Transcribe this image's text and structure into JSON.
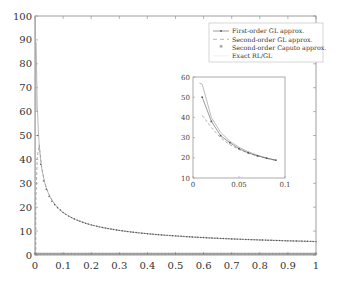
{
  "chart_data": {
    "type": "line",
    "title": "",
    "xlabel": "",
    "ylabel": "",
    "xlim": [
      0,
      1
    ],
    "ylim": [
      0,
      100
    ],
    "grid": false,
    "legend_position": "upper right",
    "x_ticks": [
      "0",
      "0.1",
      "0.2",
      "0.3",
      "0.4",
      "0.5",
      "0.6",
      "0.7",
      "0.8",
      "0.9",
      "1"
    ],
    "y_ticks": [
      "0",
      "10",
      "20",
      "30",
      "40",
      "50",
      "60",
      "70",
      "80",
      "90",
      "100"
    ],
    "legend": [
      {
        "label": "First-order GL approx.",
        "style": "solid-with-dots"
      },
      {
        "label": "Second-order GL approx.",
        "style": "dashed"
      },
      {
        "label": "Second-order Caputo approx.",
        "style": "asterisk-markers"
      },
      {
        "label": "Exact RL/GL",
        "style": "solid"
      }
    ],
    "x": [
      0.01,
      0.02,
      0.03,
      0.04,
      0.05,
      0.06,
      0.07,
      0.08,
      0.09,
      0.1,
      0.15,
      0.2,
      0.3,
      0.4,
      0.5,
      0.6,
      0.7,
      0.8,
      0.9,
      1.0
    ],
    "series": [
      {
        "name": "First-order GL approx.",
        "values": [
          50,
          38,
          31,
          27.5,
          24.5,
          22.5,
          21,
          19.8,
          18.8,
          17.8,
          14.6,
          12.6,
          10.3,
          8.9,
          8.0,
          7.3,
          6.7,
          6.3,
          5.9,
          5.6
        ]
      },
      {
        "name": "Second-order GL approx.",
        "values": [
          41,
          35,
          30,
          26.5,
          24.2,
          22.3,
          20.9,
          19.7,
          18.7,
          17.8,
          14.6,
          12.6,
          10.3,
          8.9,
          8.0,
          7.3,
          6.7,
          6.3,
          5.9,
          5.6
        ]
      },
      {
        "name": "Second-order Caputo approx.",
        "values": [
          0.5,
          0.5,
          0.5,
          0.5,
          0.5,
          0.5,
          0.5,
          0.5,
          0.5,
          0.5,
          0.5,
          0.5,
          0.5,
          0.5,
          0.5,
          0.5,
          0.5,
          0.5,
          0.5,
          0.5
        ]
      },
      {
        "name": "Exact RL/GL",
        "values": [
          56.4,
          39.9,
          32.6,
          28.2,
          25.2,
          23.0,
          21.3,
          19.9,
          18.8,
          17.8,
          14.6,
          12.6,
          10.3,
          8.9,
          8.0,
          7.3,
          6.7,
          6.3,
          5.9,
          5.6
        ]
      }
    ],
    "spike_near_zero": {
      "x": 0.002,
      "y_max": 100
    },
    "inset": {
      "xlim": [
        0,
        0.1
      ],
      "ylim": [
        10,
        60
      ],
      "x_ticks": [
        "0",
        "0.05",
        "0.1"
      ],
      "y_ticks": [
        "10",
        "20",
        "30",
        "40",
        "50",
        "60"
      ]
    }
  },
  "colors": {
    "axis": "#888888",
    "first_order": "#555555",
    "second_order": "#999999",
    "caputo": "#777777",
    "exact": "#aaaaaa"
  }
}
